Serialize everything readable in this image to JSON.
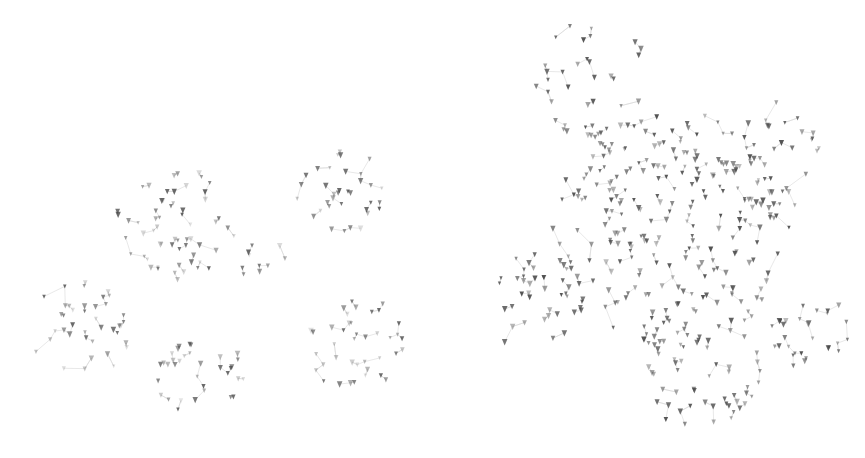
{
  "figure": {
    "node_color": "#4a4a4a",
    "edge_color": "#d8d8d8",
    "background": "#ffffff"
  },
  "left_graph": {
    "seed": 17,
    "clusters": [
      {
        "cx": 175,
        "cy": 225,
        "r": 60,
        "n": 60
      },
      {
        "cx": 340,
        "cy": 190,
        "r": 45,
        "n": 35
      },
      {
        "cx": 80,
        "cy": 330,
        "r": 50,
        "n": 40
      },
      {
        "cx": 200,
        "cy": 375,
        "r": 45,
        "n": 35
      },
      {
        "cx": 355,
        "cy": 345,
        "r": 50,
        "n": 40
      },
      {
        "cx": 270,
        "cy": 260,
        "r": 30,
        "n": 10
      }
    ],
    "opacity_range": [
      0.15,
      0.85
    ]
  },
  "right_graph": {
    "seed": 42,
    "clusters": [
      {
        "cx": 230,
        "cy": 230,
        "r": 120,
        "n": 260
      },
      {
        "cx": 150,
        "cy": 80,
        "r": 60,
        "n": 35
      },
      {
        "cx": 330,
        "cy": 160,
        "r": 60,
        "n": 40
      },
      {
        "cx": 90,
        "cy": 300,
        "r": 50,
        "n": 35
      },
      {
        "cx": 260,
        "cy": 370,
        "r": 60,
        "n": 50
      },
      {
        "cx": 370,
        "cy": 330,
        "r": 40,
        "n": 30
      }
    ],
    "opacity_range": [
      0.35,
      0.95
    ]
  },
  "caption": {
    "text": ""
  }
}
